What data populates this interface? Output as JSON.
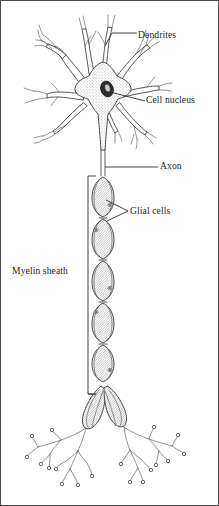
{
  "figure": {
    "type": "biological-diagram",
    "width": 219,
    "height": 506,
    "background_color": "#ffffff",
    "ink_color": "#3a3a3c",
    "has_border_frame": true
  },
  "labels": {
    "dendrites": {
      "text": "Dendrites",
      "x": 138,
      "y": 30,
      "leader": "bracket"
    },
    "cell_nucleus": {
      "text": "Cell nucleus",
      "x": 146,
      "y": 95,
      "leader": "diagonal-line"
    },
    "axon": {
      "text": "Axon",
      "x": 160,
      "y": 161,
      "leader": "horizontal-line"
    },
    "glial_cells": {
      "text": "Glial cells",
      "x": 130,
      "y": 206,
      "leader": "angle-bracket"
    },
    "myelin_sheath": {
      "text": "Myelin sheath",
      "x": 12,
      "y": 266,
      "leader": "vertical-bracket"
    }
  },
  "structures": {
    "soma": {
      "name": "cell body",
      "texture": "stipple",
      "center_x": 103,
      "center_y": 95
    },
    "nucleus": {
      "name": "cell nucleus",
      "center_x": 107,
      "center_y": 89,
      "fill": "#2b2b2d",
      "nucleolus_fill": "#c9c9cb"
    },
    "dendrite_count": 8,
    "myelin_segment_count": 9,
    "terminal_branch_count": 2
  }
}
